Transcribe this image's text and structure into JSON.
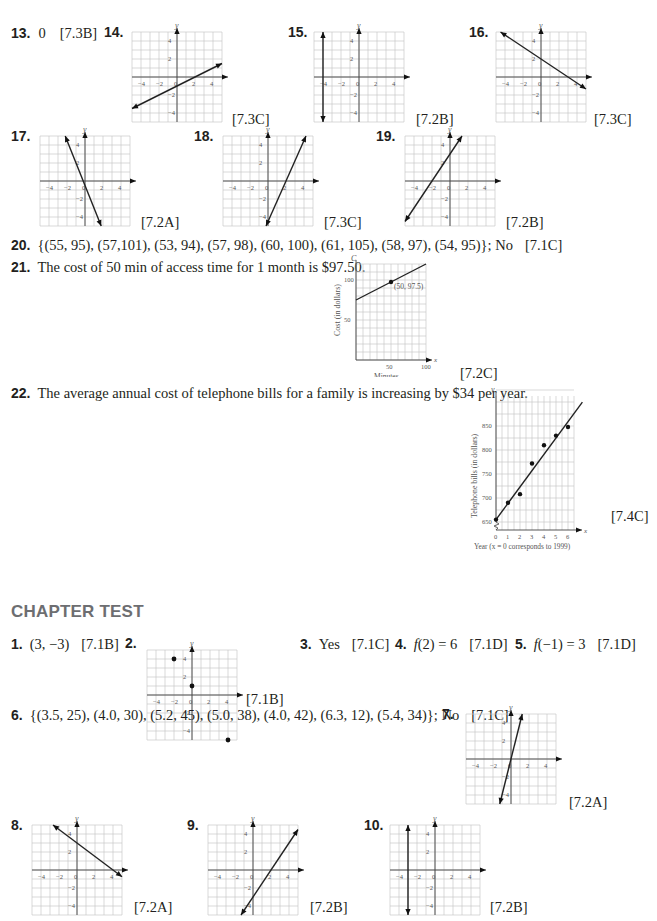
{
  "section_heading": "CHAPTER TEST",
  "review_answers": [
    {
      "number": "13.",
      "answer": "0",
      "ref": "[7.3B]"
    },
    {
      "number": "14.",
      "ref": "[7.3C]",
      "graph": {
        "type": "line",
        "slope": 0.5,
        "intercept": -1
      }
    },
    {
      "number": "15.",
      "ref": "[7.2B]",
      "graph": {
        "type": "vertical",
        "x": -4
      }
    },
    {
      "number": "16.",
      "ref": "[7.3C]",
      "graph": {
        "type": "line",
        "slope": -0.6667,
        "intercept": 2
      }
    },
    {
      "number": "17.",
      "ref": "[7.2A]",
      "graph": {
        "type": "line",
        "slope": -2.5,
        "intercept": -0.5
      }
    },
    {
      "number": "18.",
      "ref": "[7.3C]",
      "graph": {
        "type": "line",
        "slope": 2.25,
        "intercept": -4.5
      }
    },
    {
      "number": "19.",
      "ref": "[7.2B]",
      "graph": {
        "type": "line",
        "slope": 1.5,
        "intercept": 3
      }
    },
    {
      "number": "20.",
      "answer": "{(55, 95), (57,101), (53, 94), (57, 98), (60, 100), (61, 105), (58, 97), (54, 95)}; No",
      "ref": "[7.1C]"
    },
    {
      "number": "21.",
      "answer": "The cost of 50 min of access time for 1 month is $97.50.",
      "ref": "[7.2C]"
    },
    {
      "number": "22.",
      "answer": "The average annual cost of telephone bills for a family is increasing by $34 per year.",
      "ref": "[7.4C]"
    }
  ],
  "chapter_test": [
    {
      "number": "1.",
      "answer": "(3, −3)",
      "ref": "[7.1B]"
    },
    {
      "number": "2.",
      "ref": "[7.1B]",
      "graph": {
        "type": "points",
        "points": [
          [
            -2,
            4
          ],
          [
            0,
            1
          ],
          [
            4,
            -5
          ]
        ]
      }
    },
    {
      "number": "3.",
      "answer": "Yes",
      "ref": "[7.1C]"
    },
    {
      "number": "4.",
      "answer_prefix": "f",
      "answer": "(2) = 6",
      "ref": "[7.1D]"
    },
    {
      "number": "5.",
      "answer_prefix": "f",
      "answer": "(−1) = 3",
      "ref": "[7.1D]"
    },
    {
      "number": "6.",
      "answer": "{(3.5, 25), (4.0, 30), (5.2, 45), (5.0, 38), (4.0, 42), (6.3, 12), (5.4, 34)}; No",
      "ref": "[7.1C]"
    },
    {
      "number": "7.",
      "ref": "[7.2A]",
      "graph": {
        "type": "line",
        "slope": 4,
        "intercept": 0
      }
    },
    {
      "number": "8.",
      "ref": "[7.2A]",
      "graph": {
        "type": "line",
        "slope": -0.75,
        "intercept": 3
      }
    },
    {
      "number": "9.",
      "ref": "[7.2B]",
      "graph": {
        "type": "line",
        "slope": 1.5,
        "intercept": -3
      }
    },
    {
      "number": "10.",
      "ref": "[7.2B]",
      "graph": {
        "type": "vertical",
        "x": -3
      }
    }
  ],
  "grid_labels": {
    "x_axis": "x",
    "y_axis": "y",
    "ticks_x": [
      "−4",
      "−2",
      "0",
      "2",
      "4"
    ],
    "ticks_y": [
      "4",
      "2",
      "−2",
      "−4"
    ]
  },
  "chart_data": [
    {
      "type": "line",
      "title": "",
      "xlabel": "Minutes",
      "ylabel": "Cost (in dollars)",
      "y_axis_letter": "C",
      "x_axis_letter": "x",
      "xlim": [
        0,
        100
      ],
      "ylim": [
        0,
        120
      ],
      "x_ticks": [
        "50",
        "100"
      ],
      "y_ticks": [
        "50",
        "100"
      ],
      "line": {
        "slope": 0.45,
        "intercept": 75
      },
      "points": [
        {
          "x": 50,
          "y": 97.5,
          "label": "(50, 97.5)"
        }
      ],
      "grid": true
    },
    {
      "type": "scatter",
      "title": "",
      "xlabel": "Year (x = 0 corresponds to 1999)",
      "ylabel": "Telephone bills (in dollars)",
      "y_axis_letter": "y",
      "x_axis_letter": "x",
      "xlim": [
        0,
        6
      ],
      "ylim": [
        650,
        900
      ],
      "x_ticks": [
        "0",
        "1",
        "2",
        "3",
        "4",
        "5",
        "6"
      ],
      "y_ticks": [
        "650",
        "700",
        "750",
        "800",
        "850"
      ],
      "x": [
        0,
        1,
        2,
        3,
        4,
        5,
        6
      ],
      "y": [
        655,
        690,
        708,
        772,
        810,
        830,
        848
      ],
      "regression_line": {
        "slope": 34,
        "intercept": 655
      },
      "grid": true
    }
  ]
}
